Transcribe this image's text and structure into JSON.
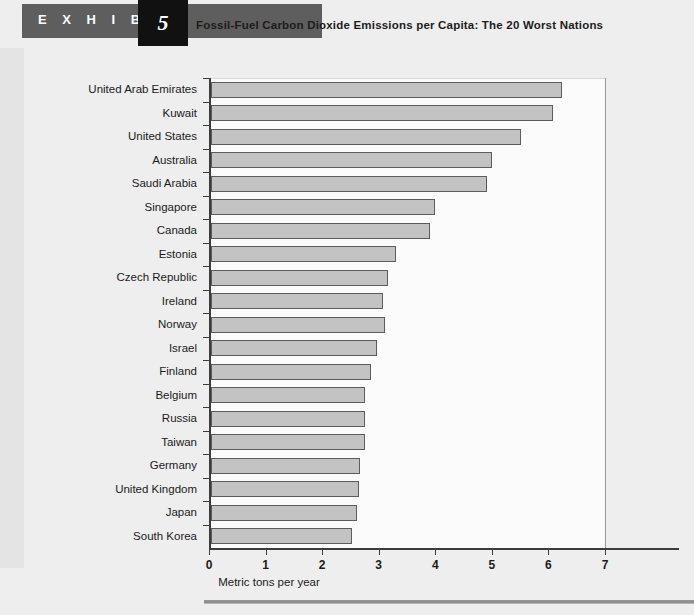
{
  "header": {
    "exhibit_word": "E X H I B I T",
    "exhibit_number": "5",
    "title": "Fossil-Fuel Carbon Dioxide Emissions per Capita: The 20 Worst Nations"
  },
  "chart_data": {
    "type": "bar",
    "orientation": "horizontal",
    "title": "Fossil-Fuel Carbon Dioxide Emissions per Capita: The 20 Worst Nations",
    "xlabel": "Metric tons per year",
    "ylabel": "",
    "xlim": [
      0,
      7
    ],
    "xticks": [
      0,
      1,
      2,
      3,
      4,
      5,
      6,
      7
    ],
    "xtick_labels": [
      "0",
      "1",
      "2",
      "3",
      "4",
      "5",
      "6",
      "7"
    ],
    "grid": false,
    "legend": null,
    "bar_fill_color": "#c3c3c3",
    "bar_edge_color": "#5c5c5c",
    "categories": [
      "United Arab Emirates",
      "Kuwait",
      "United States",
      "Australia",
      "Saudi Arabia",
      "Singapore",
      "Canada",
      "Estonia",
      "Czech Republic",
      "Ireland",
      "Norway",
      "Israel",
      "Finland",
      "Belgium",
      "Russia",
      "Taiwan",
      "Germany",
      "United Kingdom",
      "Japan",
      "South Korea"
    ],
    "values": [
      6.2,
      6.05,
      5.48,
      4.97,
      4.88,
      3.96,
      3.87,
      3.27,
      3.13,
      3.04,
      3.07,
      2.93,
      2.83,
      2.72,
      2.72,
      2.72,
      2.63,
      2.62,
      2.58,
      2.49
    ]
  }
}
